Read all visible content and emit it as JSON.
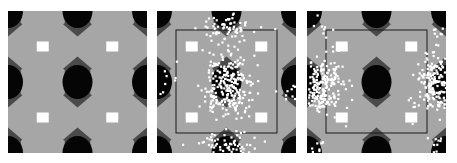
{
  "figure": {
    "panel_count": 3,
    "colors": {
      "background": "#ffffff",
      "light": "#a6a6a6",
      "dark": "#4a4a4a",
      "black": "#050505",
      "white_cell": "#ffffff",
      "points": "#ffffff",
      "frame": "#1a1a1a"
    },
    "panels": [
      {
        "id": "panel-1",
        "x": 8,
        "has_points": false,
        "has_inner_frame": false,
        "points_pattern": "none"
      },
      {
        "id": "panel-2",
        "x": 157,
        "has_points": true,
        "has_inner_frame": true,
        "points_pattern": "center-and-top-bottom"
      },
      {
        "id": "panel-3",
        "x": 307,
        "has_points": true,
        "has_inner_frame": true,
        "points_pattern": "left-and-right"
      }
    ]
  }
}
